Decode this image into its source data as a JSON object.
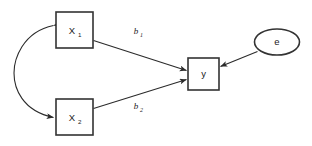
{
  "diagram": {
    "type": "path-diagram",
    "title": "",
    "background_color": "#ffffff",
    "stroke_color": "#2b2b2b",
    "node_border_color": "#333333",
    "nodes": [
      {
        "id": "x1",
        "shape": "rectangle",
        "label": "X",
        "subscript": "1",
        "role": "observed-predictor"
      },
      {
        "id": "x2",
        "shape": "rectangle",
        "label": "X",
        "subscript": "2",
        "role": "observed-predictor"
      },
      {
        "id": "y",
        "shape": "rectangle",
        "label": "y",
        "subscript": "",
        "role": "observed-outcome"
      },
      {
        "id": "e",
        "shape": "ellipse",
        "label": "e",
        "subscript": "",
        "role": "error-term"
      }
    ],
    "edges": [
      {
        "id": "x1-to-y",
        "from": "x1",
        "to": "y",
        "label": "b",
        "subscript": "1",
        "arrow": "single",
        "style": "straight"
      },
      {
        "id": "x2-to-y",
        "from": "x2",
        "to": "y",
        "label": "b",
        "subscript": "2",
        "arrow": "single",
        "style": "straight"
      },
      {
        "id": "e-to-y",
        "from": "e",
        "to": "y",
        "label": "",
        "subscript": "",
        "arrow": "single",
        "style": "straight"
      },
      {
        "id": "x1-x2-correlation",
        "from": "x1",
        "to": "x2",
        "label": "",
        "subscript": "",
        "arrow": "double",
        "style": "curved"
      }
    ]
  }
}
